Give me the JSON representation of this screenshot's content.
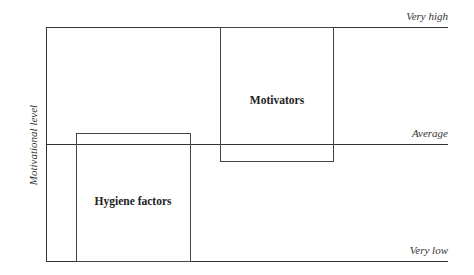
{
  "diagram": {
    "axis_label": "Motivational level",
    "levels": [
      {
        "id": "very-high",
        "label": "Very high"
      },
      {
        "id": "average",
        "label": "Average"
      },
      {
        "id": "very-low",
        "label": "Very low"
      }
    ],
    "boxes": [
      {
        "id": "motivators",
        "label": "Motivators"
      },
      {
        "id": "hygiene-factors",
        "label": "Hygiene factors"
      }
    ],
    "colors": {
      "line": "#333333",
      "text": "#222222",
      "background": "#ffffff"
    }
  }
}
